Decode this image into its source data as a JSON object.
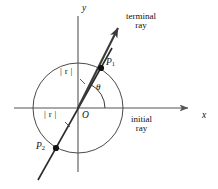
{
  "figure": {
    "axes": {
      "x_label": "x",
      "y_label": "y"
    },
    "labels": {
      "terminal_ray_line1": "terminal",
      "terminal_ray_line2": "ray",
      "initial_ray_line1": "initial",
      "initial_ray_line2": "ray",
      "angle": "θ",
      "origin": "O",
      "point1": "P",
      "point1_sub": "1",
      "point2": "P",
      "point2_sub": "2",
      "magnitude_upper": "| r |",
      "magnitude_lower": "| r |"
    },
    "colors": {
      "ink": "#111111",
      "axis": "#555555",
      "circle": "#4a4a4a",
      "ray": "#3a3a3a",
      "background": "#ffffff"
    },
    "geometry": {
      "origin_x": 78,
      "origin_y": 108,
      "circle_radius": 45,
      "point1_x": 101,
      "point1_y": 68,
      "point2_x": 56,
      "point2_y": 148,
      "terminal_arrow_tip_x": 118,
      "terminal_arrow_tip_y": 28,
      "x_axis_arrow_tip_x": 188,
      "line_end_x": 38,
      "line_end_y": 180
    }
  }
}
